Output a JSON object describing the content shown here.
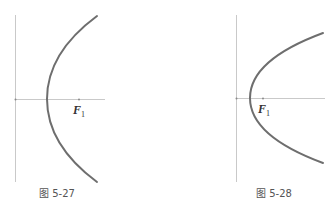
{
  "figures": [
    {
      "id": "fig-5-27",
      "caption": "图 5-27",
      "focus_label": "F",
      "focus_subscript": "1",
      "description": "Parabola opening to the right, vertex to the right of the y-axis, focus F1 on the x-axis"
    },
    {
      "id": "fig-5-28",
      "caption": "图 5-28",
      "focus_label": "F",
      "focus_subscript": "1",
      "description": "Parabola opening to the right, vertex close to the y-axis, focus F1 on the x-axis"
    }
  ],
  "colors": {
    "axis": "#c9c9c9",
    "curve": "#6e6e6e",
    "text": "#333333",
    "caption": "#555555"
  }
}
